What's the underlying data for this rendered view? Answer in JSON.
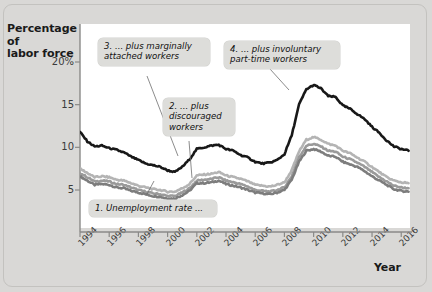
{
  "figure": {
    "background_color": "#d9d8d6",
    "plot_background_color": "#ffffff"
  },
  "axes": {
    "y_title_line1": "Percentage of",
    "y_title_line2": "labor force",
    "x_title": "Year",
    "y_ticks": [
      "20%",
      "15",
      "10",
      "5"
    ],
    "x_ticks": [
      "1994",
      "1996",
      "1998",
      "2000",
      "2002",
      "2004",
      "2006",
      "2008",
      "2010",
      "2012",
      "2014",
      "2016"
    ]
  },
  "callouts": [
    {
      "id": "callout-1",
      "text": "1. Unemployment rate ..."
    },
    {
      "id": "callout-2",
      "text": "2. ... plus\ndiscouraged\nworkers"
    },
    {
      "id": "callout-3",
      "text": "3. ... plus marginally\nattached workers"
    },
    {
      "id": "callout-4",
      "text": "4. ... plus involuntary\npart-time workers"
    }
  ],
  "chart_data": {
    "type": "line",
    "title": "",
    "xlabel": "Year",
    "ylabel": "Percentage of labor force",
    "xlim": [
      1994,
      2016.6
    ],
    "ylim": [
      2.0,
      21.5
    ],
    "grid": false,
    "legend_position": "none",
    "yticks": [
      5,
      10,
      15,
      20
    ],
    "xticks": [
      1994,
      1996,
      1998,
      2000,
      2002,
      2004,
      2006,
      2008,
      2010,
      2012,
      2014,
      2016
    ],
    "x": [
      1994.0,
      1994.5,
      1995.0,
      1995.5,
      1996.0,
      1996.5,
      1997.0,
      1997.5,
      1998.0,
      1998.5,
      1999.0,
      1999.5,
      2000.0,
      2000.5,
      2001.0,
      2001.5,
      2002.0,
      2002.5,
      2003.0,
      2003.5,
      2004.0,
      2004.5,
      2005.0,
      2005.5,
      2006.0,
      2006.5,
      2007.0,
      2007.5,
      2008.0,
      2008.5,
      2009.0,
      2009.5,
      2010.0,
      2010.5,
      2011.0,
      2011.5,
      2012.0,
      2012.5,
      2013.0,
      2013.5,
      2014.0,
      2014.5,
      2015.0,
      2015.5,
      2016.0,
      2016.5
    ],
    "series": [
      {
        "name": "1. Unemployment rate (U-3)",
        "color": "#7d7d7d",
        "width": 2.6,
        "values": [
          6.6,
          6.1,
          5.6,
          5.7,
          5.6,
          5.3,
          5.2,
          4.9,
          4.7,
          4.5,
          4.3,
          4.2,
          4.0,
          4.0,
          4.4,
          4.9,
          5.8,
          5.8,
          5.9,
          6.1,
          5.7,
          5.5,
          5.3,
          5.0,
          4.7,
          4.6,
          4.5,
          4.7,
          5.0,
          6.2,
          8.3,
          9.6,
          9.8,
          9.5,
          9.0,
          8.9,
          8.3,
          8.0,
          7.7,
          7.2,
          6.6,
          6.1,
          5.6,
          5.1,
          4.9,
          4.8
        ]
      },
      {
        "name": "2. ... plus discouraged workers",
        "color": "#9a9a9a",
        "width": 2.6,
        "values": [
          7.0,
          6.5,
          6.0,
          6.1,
          6.0,
          5.7,
          5.6,
          5.3,
          5.0,
          4.8,
          4.6,
          4.5,
          4.3,
          4.3,
          4.7,
          5.2,
          6.1,
          6.2,
          6.3,
          6.5,
          6.1,
          5.9,
          5.7,
          5.4,
          5.0,
          4.9,
          4.8,
          5.0,
          5.3,
          6.6,
          8.8,
          10.2,
          10.4,
          10.1,
          9.6,
          9.5,
          8.9,
          8.6,
          8.2,
          7.7,
          7.1,
          6.5,
          6.0,
          5.5,
          5.3,
          5.2
        ]
      },
      {
        "name": "3. ... plus marginally attached workers",
        "color": "#b4b4b4",
        "width": 2.6,
        "values": [
          7.5,
          7.0,
          6.5,
          6.6,
          6.5,
          6.2,
          6.1,
          5.8,
          5.5,
          5.3,
          5.1,
          5.0,
          4.8,
          4.8,
          5.2,
          5.7,
          6.7,
          6.8,
          6.9,
          7.1,
          6.7,
          6.5,
          6.3,
          6.0,
          5.6,
          5.5,
          5.4,
          5.6,
          5.9,
          7.3,
          9.5,
          10.9,
          11.2,
          10.9,
          10.4,
          10.2,
          9.6,
          9.3,
          8.8,
          8.3,
          7.7,
          7.1,
          6.5,
          6.1,
          5.9,
          5.8
        ]
      },
      {
        "name": "4. ... plus involuntary part-time workers (U-6)",
        "color": "#181818",
        "width": 2.6,
        "values": [
          11.8,
          10.7,
          10.1,
          10.2,
          9.9,
          9.7,
          9.4,
          8.9,
          8.5,
          8.1,
          7.9,
          7.7,
          7.3,
          7.1,
          7.7,
          8.6,
          9.8,
          10.0,
          10.2,
          10.3,
          9.8,
          9.6,
          9.1,
          8.8,
          8.3,
          8.1,
          8.2,
          8.5,
          9.2,
          11.4,
          15.0,
          16.8,
          17.3,
          16.9,
          16.0,
          15.9,
          14.9,
          14.5,
          13.9,
          13.3,
          12.4,
          11.7,
          10.8,
          10.1,
          9.8,
          9.6
        ]
      }
    ]
  }
}
